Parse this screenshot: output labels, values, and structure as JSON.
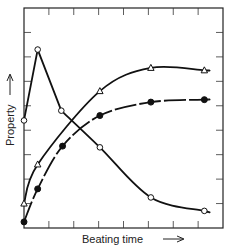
{
  "chart_data": {
    "type": "line",
    "title": "",
    "xlabel": "Beating time",
    "ylabel": "Property",
    "xlabel_arrow": "→",
    "ylabel_arrow": "→",
    "grid": false,
    "legend": null,
    "tick_labels": false,
    "axis_ticks": {
      "x_count": 9,
      "y_count": 9
    },
    "xlim": [
      0,
      8
    ],
    "ylim": [
      0,
      9
    ],
    "series": [
      {
        "name": "open-circle",
        "marker": "open-circle",
        "points": [
          {
            "x": 0.0,
            "y": 4.4
          },
          {
            "x": 0.55,
            "y": 7.3
          },
          {
            "x": 1.5,
            "y": 4.8
          },
          {
            "x": 3.05,
            "y": 3.3
          },
          {
            "x": 5.1,
            "y": 1.25
          },
          {
            "x": 7.25,
            "y": 0.7
          }
        ],
        "curve_end": {
          "x": 7.4,
          "y": 0.65
        }
      },
      {
        "name": "open-triangle",
        "marker": "open-triangle",
        "points": [
          {
            "x": 0.0,
            "y": 1.0
          },
          {
            "x": 0.55,
            "y": 2.6
          },
          {
            "x": 3.05,
            "y": 5.6
          },
          {
            "x": 5.1,
            "y": 6.55
          },
          {
            "x": 7.25,
            "y": 6.45
          }
        ],
        "curve_end": {
          "x": 7.4,
          "y": 6.45
        }
      },
      {
        "name": "filled-circle",
        "marker": "filled-circle",
        "points": [
          {
            "x": 0.0,
            "y": 0.25
          },
          {
            "x": 0.55,
            "y": 1.6
          },
          {
            "x": 1.55,
            "y": 3.35
          },
          {
            "x": 3.05,
            "y": 4.6
          },
          {
            "x": 5.1,
            "y": 5.15
          },
          {
            "x": 7.25,
            "y": 5.25
          }
        ],
        "curve_end": {
          "x": 7.4,
          "y": 5.25
        }
      }
    ]
  },
  "labels": {
    "xlabel": "Beating time",
    "ylabel": "Property"
  }
}
